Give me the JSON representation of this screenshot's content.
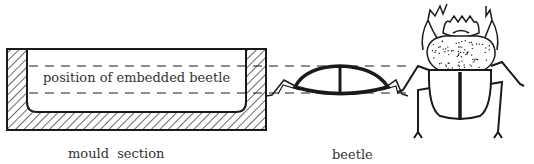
{
  "figure": {
    "labels": {
      "position": "position of embedded beetle",
      "mould": "mould section",
      "beetle": "beetle"
    },
    "colors": {
      "ink": "#1a1a1a",
      "text": "#333333",
      "background": "#ffffff"
    },
    "parts": [
      "mould-section",
      "embedded-position-guides",
      "beetle-side-view",
      "beetle-top-view"
    ]
  }
}
